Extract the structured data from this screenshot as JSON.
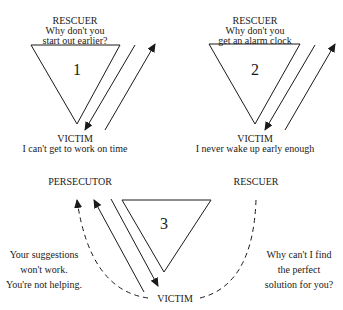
{
  "diagram": {
    "type": "drama-triangle-sequence",
    "panels": [
      {
        "number": "1",
        "top_role": "RESCUER",
        "top_line1": "Why don't you",
        "top_line2": "start out earlier?",
        "bottom_role": "VICTIM",
        "bottom_line": "I can't get to work on time"
      },
      {
        "number": "2",
        "top_role": "RESCUER",
        "top_line1": "Why don't you",
        "top_line2": "get an alarm clock",
        "bottom_role": "VICTIM",
        "bottom_line": "I never wake up early enough"
      },
      {
        "number": "3",
        "left_role": "PERSECUTOR",
        "right_role": "RESCUER",
        "bottom_role": "VICTIM",
        "left_quote": [
          "Your suggestions",
          "won't work.",
          "You're not helping."
        ],
        "right_quote": [
          "Why can't I find",
          "the perfect",
          "solution for you?"
        ]
      }
    ],
    "stroke_color": "#1a1a1a",
    "background": "#ffffff"
  }
}
